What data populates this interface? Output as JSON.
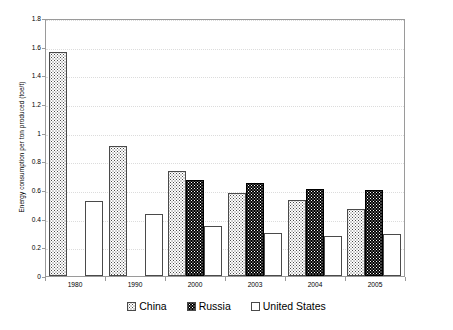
{
  "chart_data": {
    "type": "bar",
    "title": "",
    "xlabel": "",
    "ylabel": "Energy consumption per ton produced (toe/t)",
    "categories": [
      "1980",
      "1990",
      "2000",
      "2003",
      "2004",
      "2005"
    ],
    "series": [
      {
        "name": "China",
        "values": [
          1.56,
          0.91,
          0.73,
          0.58,
          0.53,
          0.47
        ],
        "color": "#ffffff",
        "pattern": "fine-dot-dark"
      },
      {
        "name": "Russia",
        "values": [
          null,
          null,
          0.67,
          0.65,
          0.61,
          0.6
        ],
        "color": "#000000",
        "pattern": "dot-white-on-black"
      },
      {
        "name": "United States",
        "values": [
          0.52,
          0.43,
          0.35,
          0.3,
          0.28,
          0.295
        ],
        "color": "#ffffff",
        "pattern": "fine-dot-light"
      }
    ],
    "ylim": [
      0,
      1.8
    ],
    "ytick_step": 0.2,
    "yticks": [
      "0",
      "0.2",
      "0.4",
      "0.6",
      "0.8",
      "1",
      "1.2",
      "1.4",
      "1.6",
      "1.8"
    ],
    "grid": true,
    "legend_position": "bottom"
  },
  "legend": {
    "items": [
      {
        "label": "China"
      },
      {
        "label": "Russia"
      },
      {
        "label": "United States"
      }
    ]
  }
}
